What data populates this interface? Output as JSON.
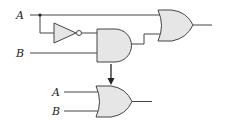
{
  "diagram": {
    "top_circuit": {
      "inputs": [
        {
          "label": "A"
        },
        {
          "label": "B"
        }
      ],
      "gates": [
        "NOT",
        "AND",
        "OR"
      ]
    },
    "bottom_circuit": {
      "inputs": [
        {
          "label": "A"
        },
        {
          "label": "B"
        }
      ],
      "gates": [
        "OR"
      ]
    },
    "colors": {
      "gate_fill": "#e6e6e6",
      "stroke": "#444444"
    }
  }
}
